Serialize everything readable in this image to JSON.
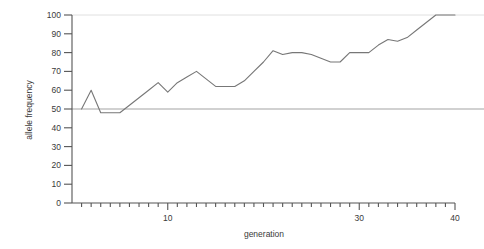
{
  "chart_data": {
    "type": "line",
    "title": "",
    "xlabel": "generation",
    "ylabel": "allele frequency",
    "xlim": [
      0,
      40
    ],
    "ylim": [
      0,
      100
    ],
    "grid": false,
    "legend": null,
    "x_major_ticks": [
      10,
      30,
      40
    ],
    "x_major_tick_labels": [
      "10",
      "30",
      "40"
    ],
    "x_minor_tick_step": 1,
    "y_ticks": [
      0,
      10,
      20,
      30,
      40,
      50,
      60,
      70,
      80,
      90,
      100
    ],
    "y_tick_labels": [
      "0",
      "10",
      "20",
      "30",
      "40",
      "50",
      "60",
      "70",
      "80",
      "90",
      "100"
    ],
    "reference_lines": [
      {
        "name": "fifty-percent-line",
        "y": 50,
        "color": "#999999"
      },
      {
        "name": "hundred-percent-line",
        "y": 100,
        "color": "#dddddd"
      }
    ],
    "series": [
      {
        "name": "allele frequency trajectory",
        "color": "#777777",
        "x": [
          1,
          2,
          3,
          4,
          5,
          6,
          7,
          8,
          9,
          10,
          11,
          12,
          13,
          14,
          15,
          16,
          17,
          18,
          19,
          20,
          21,
          22,
          23,
          24,
          25,
          26,
          27,
          28,
          29,
          30,
          31,
          32,
          33,
          34,
          35,
          36,
          37,
          38,
          39,
          40
        ],
        "values": [
          50,
          60,
          48,
          48,
          48,
          52,
          56,
          60,
          64,
          59,
          64,
          67,
          70,
          66,
          62,
          62,
          62,
          65,
          70,
          75,
          81,
          79,
          80,
          80,
          79,
          77,
          75,
          75,
          80,
          80,
          80,
          84,
          87,
          86,
          88,
          92,
          96,
          100,
          100,
          100
        ]
      }
    ]
  },
  "axis": {
    "y_label_text": "allele frequency",
    "x_label_text": "generation"
  }
}
